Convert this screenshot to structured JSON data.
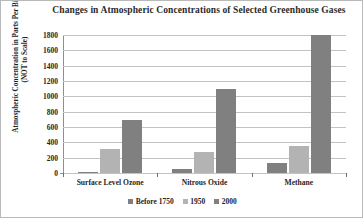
{
  "chart_data": {
    "type": "bar",
    "title": "Changes in Atmospheric Concentrations of Selected Greenhouse Gases",
    "xlabel": "",
    "ylabel": "Atmospheric Concentration in Parts Per Billion (NOT to Scale)",
    "categories": [
      "Surface Level Ozone",
      "Nitrous Oxide",
      "Methane"
    ],
    "series": [
      {
        "name": "Before 1750",
        "color": "#808080",
        "values": [
          10,
          50,
          130
        ]
      },
      {
        "name": "1950",
        "color": "#b3b3b3",
        "values": [
          310,
          270,
          350
        ]
      },
      {
        "name": "2000",
        "color": "#808080",
        "values": [
          690,
          1100,
          1800
        ]
      }
    ],
    "ylim": [
      0,
      1800
    ],
    "yticks": [
      0,
      200,
      400,
      600,
      800,
      1000,
      1200,
      1400,
      1600,
      1800
    ],
    "ytick_labels": [
      "0",
      "200",
      "400",
      "600",
      "800",
      "1000",
      "1200",
      "1400",
      "1600",
      "1800"
    ],
    "grid": true,
    "legend_position": "bottom"
  },
  "legend": {
    "items": [
      {
        "label": "Before 1750",
        "color": "#808080"
      },
      {
        "label": "1950",
        "color": "#b3b3b3"
      },
      {
        "label": "2000",
        "color": "#808080"
      }
    ]
  }
}
